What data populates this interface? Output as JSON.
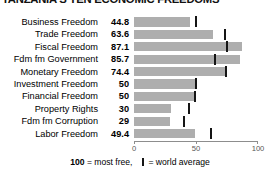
{
  "title": "TANZANIA'S TEN ECONOMIC FREEDOMS",
  "legend": {
    "max_value": "100",
    "most_free_text": "= most free,",
    "world_average_text": "= world average",
    "tick_glyph": "world-average-tick"
  },
  "axis": {
    "ticks": [
      "0",
      "50",
      "100"
    ],
    "tick_values": [
      0,
      50,
      100
    ],
    "min": 0,
    "max": 100
  },
  "colors": {
    "bar": "#aeaeae",
    "world_average_tick": "#151515",
    "axis": "#8d8d8d",
    "text": "#000000",
    "background": "#ffffff"
  },
  "chart_data": {
    "type": "bar",
    "orientation": "horizontal",
    "title": "TANZANIA'S TEN ECONOMIC FREEDOMS",
    "xlabel": "",
    "ylabel": "",
    "xlim": [
      0,
      100
    ],
    "grid": false,
    "legend_position": "bottom",
    "categories": [
      "Business Freedom",
      "Trade Freedom",
      "Fiscal Freedom",
      "Fdm fm Government",
      "Monetary Freedom",
      "Investment Freedom",
      "Financial Freedom",
      "Property Rights",
      "Fdm fm Corruption",
      "Labor Freedom"
    ],
    "values": [
      44.8,
      63.6,
      87.1,
      85.7,
      74.4,
      50,
      50,
      30,
      29,
      49.4
    ],
    "value_labels": [
      "44.8",
      "63.6",
      "87.1",
      "85.7",
      "74.4",
      "50",
      "50",
      "30",
      "29",
      "49.4"
    ],
    "series": [
      {
        "name": "Tanzania",
        "values": [
          44.8,
          63.6,
          87.1,
          85.7,
          74.4,
          50,
          50,
          30,
          29,
          49.4
        ]
      },
      {
        "name": "world average",
        "values": [
          50.0,
          73.3,
          74.9,
          65.0,
          74.0,
          50.0,
          49.0,
          44.0,
          40.5,
          62.1
        ]
      }
    ]
  },
  "rows": [
    {
      "label": "Business Freedom",
      "value": "44.8",
      "value_num": 44.8,
      "world_average": 50.0
    },
    {
      "label": "Trade Freedom",
      "value": "63.6",
      "value_num": 63.6,
      "world_average": 73.3
    },
    {
      "label": "Fiscal Freedom",
      "value": "87.1",
      "value_num": 87.1,
      "world_average": 74.9
    },
    {
      "label": "Fdm fm Government",
      "value": "85.7",
      "value_num": 85.7,
      "world_average": 65.0
    },
    {
      "label": "Monetary Freedom",
      "value": "74.4",
      "value_num": 74.4,
      "world_average": 74.0
    },
    {
      "label": "Investment Freedom",
      "value": "50",
      "value_num": 50.0,
      "world_average": 50.0
    },
    {
      "label": "Financial Freedom",
      "value": "50",
      "value_num": 50.0,
      "world_average": 49.0
    },
    {
      "label": "Property Rights",
      "value": "30",
      "value_num": 30.0,
      "world_average": 44.0
    },
    {
      "label": "Fdm fm Corruption",
      "value": "29",
      "value_num": 29.0,
      "world_average": 40.5
    },
    {
      "label": "Labor Freedom",
      "value": "49.4",
      "value_num": 49.4,
      "world_average": 62.1
    }
  ]
}
